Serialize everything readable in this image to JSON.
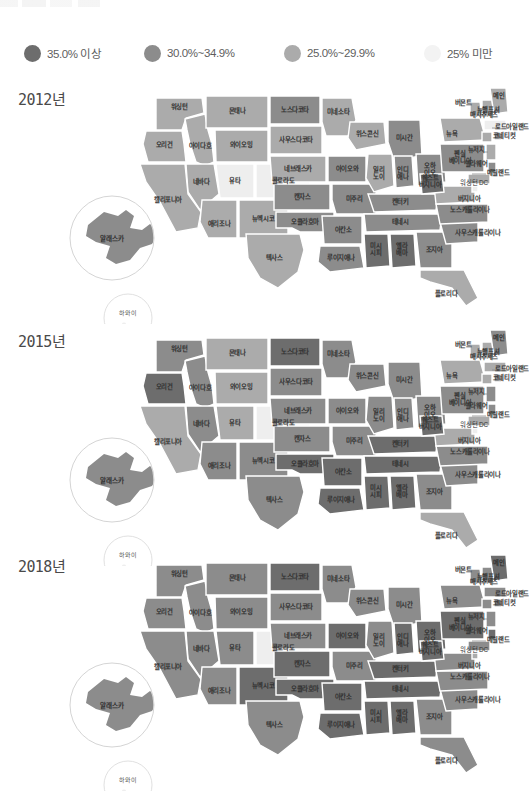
{
  "legend": {
    "items": [
      {
        "label": "35.0% 이상",
        "color": "#6d6d6d",
        "swatch": "legend-swatch-dark"
      },
      {
        "label": "30.0%~34.9%",
        "color": "#8c8c8c",
        "swatch": "legend-swatch-medium"
      },
      {
        "label": "25.0%~29.9%",
        "color": "#ababab",
        "swatch": "legend-swatch-light"
      },
      {
        "label": "25% 미만",
        "color": "#f0f0f0",
        "swatch": "legend-swatch-lightest"
      }
    ]
  },
  "palette": {
    "tier_35_plus": "#6d6d6d",
    "tier_30_34": "#8c8c8c",
    "tier_25_29": "#ababab",
    "tier_under_25": "#eeeeee",
    "background": "#ffffff",
    "stroke": "#ffffff",
    "text": "#2f2f2f"
  },
  "panels": [
    {
      "year_label": "2012년"
    },
    {
      "year_label": "2015년"
    },
    {
      "year_label": "2018년"
    }
  ],
  "insets": {
    "alaska_label": "알래스카",
    "hawaii_label": "하와이"
  },
  "chart_data": {
    "type": "map",
    "legend_position": "top",
    "categories": [
      "35.0% 이상",
      "30.0%~34.9%",
      "25.0%~29.9%",
      "25% 미만"
    ],
    "tier_colors": [
      "#6d6d6d",
      "#8c8c8c",
      "#ababab",
      "#eeeeee"
    ],
    "state_labels": {
      "WA": "워싱턴",
      "OR": "오리건",
      "ID": "아이다호",
      "MT": "몬태나",
      "WY": "와이오밍",
      "NV": "네바다",
      "UT": "유타",
      "CO": "콜로라도",
      "CA": "캘리포니아",
      "AZ": "애리조나",
      "NM": "뉴멕시코",
      "ND": "노스다코타",
      "SD": "사우스다코타",
      "NE": "네브래스카",
      "KS": "캔자스",
      "OK": "오클라호마",
      "TX": "텍사스",
      "MN": "미네소타",
      "IA": "아이오와",
      "MO": "미주리",
      "AR": "아칸소",
      "LA": "루이지애나",
      "WI": "위스콘신",
      "IL": "일리\n노이",
      "MI": "미시간",
      "IN": "인디\n애나",
      "OH": "오하\n이오",
      "KY": "켄터키",
      "TN": "테네시",
      "MS": "미시\n시피",
      "AL": "앨라\n배마",
      "GA": "조지아",
      "FL": "플로리다",
      "SC": "사우스캐롤라이나",
      "NC": "노스캐롤라이나",
      "VA": "버지니아",
      "WV": "웨스트\n버지니아",
      "PA": "펜실\n베이니아",
      "NY": "뉴욕",
      "VT": "버몬트",
      "NH": "뉴햄프셔",
      "ME": "메인",
      "MA": "매사추세츠",
      "RI": "로드아일랜드",
      "CT": "코네티컷",
      "NJ": "뉴저지",
      "DE": "델라웨어",
      "MD": "메릴랜드",
      "DC": "워싱턴 DC",
      "AK": "알래스카",
      "HI": "하와이"
    },
    "series": [
      {
        "name": "2012년",
        "tiers": {
          "WA": 2,
          "OR": 2,
          "ID": 2,
          "MT": 2,
          "WY": 2,
          "NV": 2,
          "UT": 3,
          "CO": 3,
          "CA": 2,
          "AZ": 2,
          "NM": 2,
          "ND": 1,
          "SD": 2,
          "NE": 2,
          "KS": 1,
          "OK": 1,
          "TX": 2,
          "MN": 2,
          "IA": 1,
          "MO": 1,
          "AR": 1,
          "LA": 1,
          "WI": 2,
          "IL": 2,
          "MI": 1,
          "IN": 1,
          "OH": 1,
          "KY": 1,
          "TN": 1,
          "MS": 0,
          "AL": 0,
          "GA": 1,
          "FL": 2,
          "SC": 1,
          "NC": 1,
          "VA": 2,
          "WV": 0,
          "PA": 1,
          "NY": 2,
          "VT": 2,
          "NH": 2,
          "ME": 2,
          "MA": 3,
          "RI": 2,
          "CT": 2,
          "NJ": 2,
          "DE": 1,
          "MD": 2,
          "DC": 3,
          "AK": 1,
          "HI": 3
        }
      },
      {
        "name": "2015년",
        "tiers": {
          "WA": 1,
          "OR": 0,
          "ID": 1,
          "MT": 2,
          "WY": 2,
          "NV": 1,
          "UT": 2,
          "CO": 3,
          "CA": 2,
          "AZ": 1,
          "NM": 1,
          "ND": 0,
          "SD": 1,
          "NE": 1,
          "KS": 1,
          "OK": 0,
          "TX": 1,
          "MN": 1,
          "IA": 1,
          "MO": 1,
          "AR": 0,
          "LA": 0,
          "WI": 1,
          "IL": 1,
          "MI": 1,
          "IN": 1,
          "OH": 1,
          "KY": 0,
          "TN": 0,
          "MS": 0,
          "AL": 0,
          "GA": 1,
          "FL": 2,
          "SC": 1,
          "NC": 1,
          "VA": 2,
          "WV": 0,
          "PA": 1,
          "NY": 2,
          "VT": 2,
          "NH": 2,
          "ME": 1,
          "MA": 2,
          "RI": 2,
          "CT": 2,
          "NJ": 1,
          "DE": 1,
          "MD": 2,
          "DC": 3,
          "AK": 1,
          "HI": 3
        }
      },
      {
        "name": "2018년",
        "tiers": {
          "WA": 1,
          "OR": 1,
          "ID": 1,
          "MT": 1,
          "WY": 1,
          "NV": 1,
          "UT": 1,
          "CO": 3,
          "CA": 1,
          "AZ": 1,
          "NM": 0,
          "ND": 0,
          "SD": 1,
          "NE": 1,
          "KS": 0,
          "OK": 0,
          "TX": 1,
          "MN": 1,
          "IA": 0,
          "MO": 1,
          "AR": 0,
          "LA": 0,
          "WI": 1,
          "IL": 1,
          "MI": 1,
          "IN": 0,
          "OH": 0,
          "KY": 0,
          "TN": 0,
          "MS": 0,
          "AL": 0,
          "GA": 1,
          "FL": 1,
          "SC": 1,
          "NC": 1,
          "VA": 1,
          "WV": 0,
          "PA": 0,
          "NY": 1,
          "VT": 1,
          "NH": 1,
          "ME": 0,
          "MA": 1,
          "RI": 1,
          "CT": 1,
          "NJ": 1,
          "DE": 0,
          "MD": 1,
          "DC": 2,
          "AK": 1,
          "HI": 3
        }
      }
    ]
  }
}
